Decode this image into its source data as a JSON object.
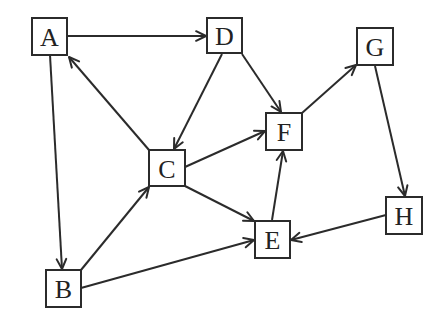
{
  "diagram": {
    "type": "directed-graph",
    "background": "#ffffff",
    "stroke_color": "#2b2b2b",
    "nodes": [
      {
        "id": "A",
        "label": "A",
        "x": 32,
        "y": 18,
        "w": 35,
        "h": 37
      },
      {
        "id": "B",
        "label": "B",
        "x": 46,
        "y": 270,
        "w": 35,
        "h": 37
      },
      {
        "id": "C",
        "label": "C",
        "x": 149,
        "y": 150,
        "w": 36,
        "h": 36
      },
      {
        "id": "D",
        "label": "D",
        "x": 207,
        "y": 18,
        "w": 35,
        "h": 35
      },
      {
        "id": "E",
        "label": "E",
        "x": 255,
        "y": 221,
        "w": 35,
        "h": 37
      },
      {
        "id": "F",
        "label": "F",
        "x": 266,
        "y": 113,
        "w": 36,
        "h": 37
      },
      {
        "id": "G",
        "label": "G",
        "x": 357,
        "y": 28,
        "w": 36,
        "h": 37
      },
      {
        "id": "H",
        "label": "H",
        "x": 386,
        "y": 197,
        "w": 36,
        "h": 37
      }
    ],
    "edges": [
      {
        "from": "A",
        "to": "D",
        "x1": 67,
        "y1": 36,
        "x2": 206,
        "y2": 36
      },
      {
        "from": "A",
        "to": "B",
        "x1": 50,
        "y1": 55,
        "x2": 62,
        "y2": 269
      },
      {
        "from": "C",
        "to": "A",
        "x1": 149,
        "y1": 150,
        "x2": 69,
        "y2": 57
      },
      {
        "from": "D",
        "to": "C",
        "x1": 222,
        "y1": 54,
        "x2": 174,
        "y2": 149
      },
      {
        "from": "D",
        "to": "F",
        "x1": 242,
        "y1": 54,
        "x2": 281,
        "y2": 112
      },
      {
        "from": "C",
        "to": "F",
        "x1": 185,
        "y1": 167,
        "x2": 265,
        "y2": 131
      },
      {
        "from": "C",
        "to": "E",
        "x1": 185,
        "y1": 186,
        "x2": 254,
        "y2": 221
      },
      {
        "from": "B",
        "to": "C",
        "x1": 81,
        "y1": 270,
        "x2": 149,
        "y2": 187
      },
      {
        "from": "B",
        "to": "E",
        "x1": 81,
        "y1": 288,
        "x2": 254,
        "y2": 240
      },
      {
        "from": "E",
        "to": "F",
        "x1": 272,
        "y1": 220,
        "x2": 283,
        "y2": 151
      },
      {
        "from": "F",
        "to": "G",
        "x1": 302,
        "y1": 113,
        "x2": 356,
        "y2": 65
      },
      {
        "from": "G",
        "to": "H",
        "x1": 375,
        "y1": 66,
        "x2": 405,
        "y2": 196
      },
      {
        "from": "H",
        "to": "E",
        "x1": 386,
        "y1": 215,
        "x2": 291,
        "y2": 240
      }
    ]
  }
}
